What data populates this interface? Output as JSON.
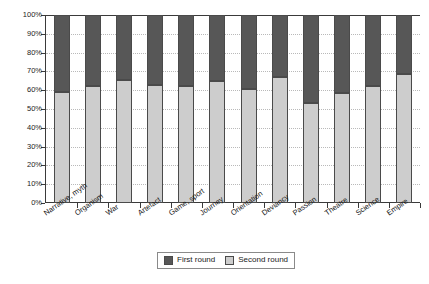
{
  "chart_data": {
    "type": "bar",
    "subtype": "stacked-percentage-column",
    "title": "",
    "xlabel": "",
    "ylabel": "",
    "ylim": [
      0,
      100
    ],
    "yticks": [
      "0%",
      "10%",
      "20%",
      "30%",
      "40%",
      "50%",
      "60%",
      "70%",
      "80%",
      "90%",
      "100%"
    ],
    "ytick_values": [
      0,
      10,
      20,
      30,
      40,
      50,
      60,
      70,
      80,
      90,
      100
    ],
    "grid": true,
    "grid_axis": "y",
    "legend_position": "bottom-center",
    "categories": [
      "Narrative, myth",
      "Organism",
      "War",
      "Artefact",
      "Game, sport",
      "Journey",
      "Orientation",
      "Deviancy",
      "Passion",
      "Theatre",
      "Science",
      "Empire"
    ],
    "series": [
      {
        "name": "First round",
        "color": "#575757",
        "values": [
          41,
          38,
          34.5,
          37,
          38,
          35,
          39.5,
          33,
          47,
          41.5,
          37.5,
          31.5
        ]
      },
      {
        "name": "Second round",
        "color": "#cdcdcd",
        "values": [
          59,
          62,
          65.5,
          63,
          62,
          65,
          60.5,
          67,
          53,
          58.5,
          62.5,
          68.5
        ]
      }
    ]
  },
  "legend": {
    "items": [
      {
        "label": "First round"
      },
      {
        "label": "Second round"
      }
    ]
  },
  "colors": {
    "first_round": "#575757",
    "second_round": "#cdcdcd",
    "axis": "#3a3a3a",
    "grid": "#b9b9b9",
    "background": "#ffffff"
  }
}
